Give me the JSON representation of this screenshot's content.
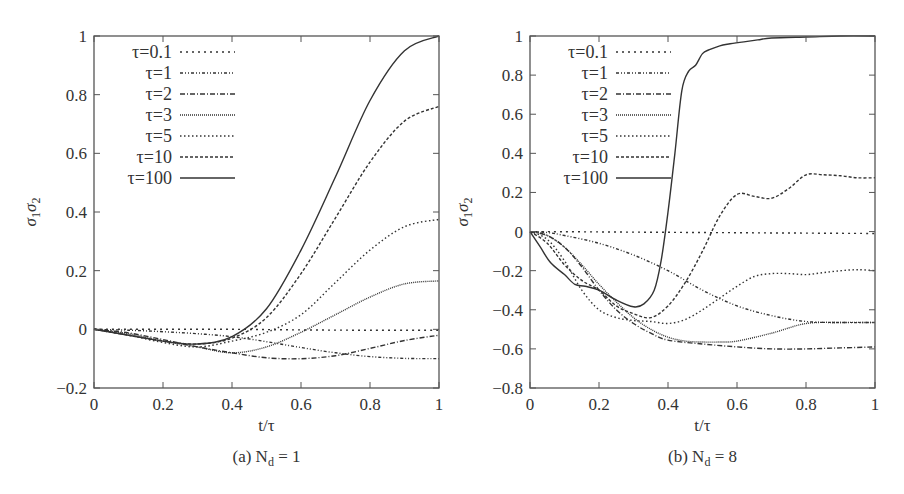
{
  "chart_data": [
    {
      "type": "line",
      "panel": "a",
      "caption": "(a) N",
      "caption_sub": "d",
      "caption_tail": " = 1",
      "xlabel": "t/τ",
      "ylabel": "σ1σ2",
      "ylabel_parts": {
        "s1": "σ",
        "sub1": "1",
        "s2": "σ",
        "sub2": "2"
      },
      "xlim": [
        0,
        1
      ],
      "ylim": [
        -0.2,
        1
      ],
      "xticks": [
        0,
        0.2,
        0.4,
        0.6,
        0.8,
        1
      ],
      "xtick_labels": [
        "0",
        "0.2",
        "0.4",
        "0.6",
        "0.8",
        "1"
      ],
      "yticks": [
        -0.2,
        0,
        0.2,
        0.4,
        0.6,
        0.8,
        1
      ],
      "ytick_labels": [
        "-0.2",
        "0",
        "0.2",
        "0.4",
        "0.6",
        "0.8",
        "1"
      ],
      "grid": false,
      "legend_position": "top-left",
      "series": [
        {
          "name": "τ=0.1",
          "style": "dashed-sparse",
          "x": [
            0,
            0.2,
            0.4,
            0.6,
            0.8,
            1.0
          ],
          "y": [
            0,
            0,
            0,
            -0.002,
            -0.003,
            -0.003
          ]
        },
        {
          "name": "τ=1",
          "style": "dash-dot-dot",
          "x": [
            0,
            0.1,
            0.2,
            0.3,
            0.4,
            0.5,
            0.6,
            0.7,
            0.8,
            0.9,
            1.0
          ],
          "y": [
            0,
            -0.003,
            -0.008,
            -0.015,
            -0.025,
            -0.042,
            -0.062,
            -0.08,
            -0.093,
            -0.099,
            -0.1
          ]
        },
        {
          "name": "τ=2",
          "style": "dash-dot",
          "x": [
            0,
            0.1,
            0.2,
            0.3,
            0.4,
            0.5,
            0.6,
            0.7,
            0.8,
            0.9,
            1.0
          ],
          "y": [
            0,
            -0.012,
            -0.035,
            -0.06,
            -0.08,
            -0.097,
            -0.1,
            -0.09,
            -0.065,
            -0.038,
            -0.02
          ]
        },
        {
          "name": "τ=3",
          "style": "fine-dotted",
          "x": [
            0,
            0.1,
            0.2,
            0.3,
            0.4,
            0.5,
            0.6,
            0.7,
            0.8,
            0.9,
            1.0
          ],
          "y": [
            0,
            -0.015,
            -0.04,
            -0.06,
            -0.08,
            -0.06,
            -0.01,
            0.05,
            0.11,
            0.155,
            0.165
          ]
        },
        {
          "name": "τ=5",
          "style": "dotted",
          "x": [
            0,
            0.1,
            0.2,
            0.3,
            0.4,
            0.5,
            0.6,
            0.7,
            0.8,
            0.9,
            1.0
          ],
          "y": [
            0,
            -0.02,
            -0.045,
            -0.06,
            -0.04,
            -0.01,
            0.05,
            0.16,
            0.27,
            0.35,
            0.375
          ]
        },
        {
          "name": "τ=10",
          "style": "dashed",
          "x": [
            0,
            0.1,
            0.2,
            0.3,
            0.4,
            0.5,
            0.6,
            0.7,
            0.8,
            0.9,
            1.0
          ],
          "y": [
            0,
            -0.02,
            -0.04,
            -0.05,
            -0.03,
            0.04,
            0.19,
            0.38,
            0.57,
            0.71,
            0.76
          ]
        },
        {
          "name": "τ=100",
          "style": "solid",
          "x": [
            0,
            0.1,
            0.2,
            0.3,
            0.4,
            0.5,
            0.6,
            0.7,
            0.8,
            0.9,
            1.0
          ],
          "y": [
            0,
            -0.02,
            -0.04,
            -0.05,
            -0.025,
            0.07,
            0.27,
            0.52,
            0.78,
            0.95,
            1.0
          ]
        }
      ]
    },
    {
      "type": "line",
      "panel": "b",
      "caption": "(b) N",
      "caption_sub": "d",
      "caption_tail": " = 8",
      "xlabel": "t/τ",
      "ylabel": "σ1σ2",
      "ylabel_parts": {
        "s1": "σ",
        "sub1": "1",
        "s2": "σ",
        "sub2": "2"
      },
      "xlim": [
        0,
        1
      ],
      "ylim": [
        -0.8,
        1
      ],
      "xticks": [
        0,
        0.2,
        0.4,
        0.6,
        0.8,
        1
      ],
      "xtick_labels": [
        "0",
        "0.2",
        "0.4",
        "0.6",
        "0.8",
        "1"
      ],
      "yticks": [
        -0.8,
        -0.6,
        -0.4,
        -0.2,
        0,
        0.2,
        0.4,
        0.6,
        0.8,
        1
      ],
      "ytick_labels": [
        "-0.8",
        "-0.6",
        "-0.4",
        "-0.2",
        "0",
        "0.2",
        "0.4",
        "0.6",
        "0.8",
        "1"
      ],
      "grid": false,
      "legend_position": "top-left",
      "series": [
        {
          "name": "τ=0.1",
          "style": "dashed-sparse",
          "x": [
            0,
            0.2,
            0.4,
            0.6,
            0.8,
            1.0
          ],
          "y": [
            0,
            -0.002,
            -0.004,
            -0.006,
            -0.008,
            -0.01
          ]
        },
        {
          "name": "τ=1",
          "style": "dash-dot-dot",
          "x": [
            0,
            0.05,
            0.1,
            0.2,
            0.3,
            0.4,
            0.5,
            0.6,
            0.7,
            0.8,
            0.9,
            1.0
          ],
          "y": [
            0,
            -0.005,
            -0.02,
            -0.06,
            -0.12,
            -0.2,
            -0.3,
            -0.38,
            -0.43,
            -0.46,
            -0.465,
            -0.465
          ]
        },
        {
          "name": "τ=2",
          "style": "dash-dot",
          "x": [
            0,
            0.05,
            0.1,
            0.15,
            0.2,
            0.25,
            0.3,
            0.35,
            0.4,
            0.5,
            0.6,
            0.7,
            0.8,
            0.9,
            1.0
          ],
          "y": [
            0,
            -0.02,
            -0.08,
            -0.18,
            -0.3,
            -0.4,
            -0.47,
            -0.52,
            -0.555,
            -0.575,
            -0.59,
            -0.6,
            -0.6,
            -0.595,
            -0.59
          ]
        },
        {
          "name": "τ=3",
          "style": "fine-dotted",
          "x": [
            0,
            0.05,
            0.1,
            0.15,
            0.2,
            0.25,
            0.3,
            0.35,
            0.4,
            0.45,
            0.5,
            0.55,
            0.6,
            0.7,
            0.8,
            0.9,
            1.0
          ],
          "y": [
            0,
            -0.02,
            -0.08,
            -0.17,
            -0.27,
            -0.36,
            -0.44,
            -0.5,
            -0.54,
            -0.56,
            -0.565,
            -0.565,
            -0.56,
            -0.52,
            -0.47,
            -0.465,
            -0.465
          ]
        },
        {
          "name": "τ=5",
          "style": "dotted",
          "x": [
            0,
            0.05,
            0.1,
            0.15,
            0.2,
            0.25,
            0.3,
            0.35,
            0.4,
            0.45,
            0.5,
            0.55,
            0.6,
            0.65,
            0.7,
            0.75,
            0.8,
            0.85,
            0.9,
            0.95,
            1.0
          ],
          "y": [
            0,
            -0.04,
            -0.15,
            -0.3,
            -0.4,
            -0.44,
            -0.455,
            -0.46,
            -0.47,
            -0.45,
            -0.4,
            -0.34,
            -0.28,
            -0.23,
            -0.215,
            -0.215,
            -0.22,
            -0.21,
            -0.2,
            -0.195,
            -0.2
          ]
        },
        {
          "name": "τ=10",
          "style": "dashed",
          "x": [
            0,
            0.05,
            0.1,
            0.15,
            0.2,
            0.25,
            0.3,
            0.35,
            0.4,
            0.45,
            0.5,
            0.55,
            0.6,
            0.65,
            0.7,
            0.75,
            0.8,
            0.85,
            0.9,
            0.95,
            1.0
          ],
          "y": [
            0,
            -0.06,
            -0.17,
            -0.25,
            -0.3,
            -0.38,
            -0.42,
            -0.44,
            -0.38,
            -0.26,
            -0.1,
            0.08,
            0.19,
            0.18,
            0.17,
            0.22,
            0.29,
            0.29,
            0.285,
            0.275,
            0.275
          ]
        },
        {
          "name": "τ=100",
          "style": "solid",
          "x": [
            0,
            0.03,
            0.06,
            0.1,
            0.13,
            0.16,
            0.2,
            0.25,
            0.3,
            0.33,
            0.36,
            0.38,
            0.4,
            0.42,
            0.44,
            0.46,
            0.48,
            0.5,
            0.52,
            0.55,
            0.58,
            0.62,
            0.66,
            0.7,
            0.8,
            0.9,
            1.0
          ],
          "y": [
            0,
            -0.08,
            -0.16,
            -0.22,
            -0.27,
            -0.28,
            -0.3,
            -0.35,
            -0.385,
            -0.37,
            -0.3,
            -0.15,
            0.1,
            0.4,
            0.72,
            0.82,
            0.85,
            0.91,
            0.93,
            0.95,
            0.96,
            0.97,
            0.98,
            0.99,
            0.995,
            1.0,
            1.0
          ]
        }
      ]
    }
  ]
}
